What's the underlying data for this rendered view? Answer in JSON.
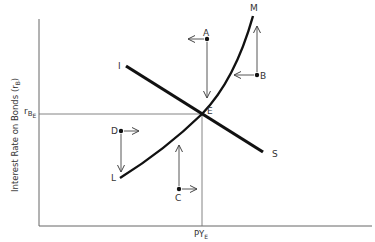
{
  "diagram": {
    "y_axis_label": "Interest Rate on Bonds (r",
    "y_axis_label_sub": "B",
    "y_axis_label_close": ")",
    "y_tick_label": "r",
    "y_tick_sub": "B",
    "y_tick_subsub": "E",
    "x_tick_label": "PY",
    "x_tick_sub": "E",
    "curve_LM": {
      "start_label": "L",
      "end_label": "M"
    },
    "line_IS": {
      "start_label": "I",
      "end_label": "S"
    },
    "equilibrium_label": "E",
    "points": [
      {
        "label": "A",
        "arrows": [
          "left",
          "down"
        ]
      },
      {
        "label": "B",
        "arrows": [
          "left",
          "up"
        ]
      },
      {
        "label": "C",
        "arrows": [
          "right",
          "up"
        ]
      },
      {
        "label": "D",
        "arrows": [
          "right",
          "down"
        ]
      }
    ]
  }
}
